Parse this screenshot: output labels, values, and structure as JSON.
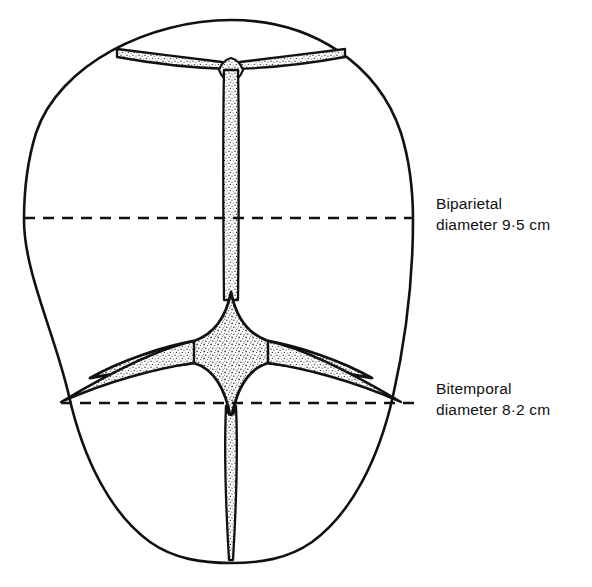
{
  "figure": {
    "background_color": "#ffffff",
    "ink_color": "#111111",
    "stipple_color": "#3a3a3a"
  },
  "anatomy": {
    "skull_outline": "ovoid fetal skull seen from above",
    "sagittal_suture": "sagittal-suture",
    "coronal_suture": "coronal-suture",
    "lambdoid_suture": "lambdoid-suture",
    "anterior_fontanelle": "anterior-fontanelle",
    "posterior_fontanelle": "posterior-fontanelle"
  },
  "measurements": [
    {
      "id": "biparietal",
      "name": "Biparietal",
      "line1": "Biparietal",
      "line2": "diameter 9·5 cm",
      "value": 9.5,
      "unit": "cm",
      "y": 218
    },
    {
      "id": "bitemporal",
      "name": "Bitemporal",
      "line1": "Bitemporal",
      "line2": "diameter 8·2 cm",
      "value": 8.2,
      "unit": "cm",
      "y": 403
    }
  ]
}
